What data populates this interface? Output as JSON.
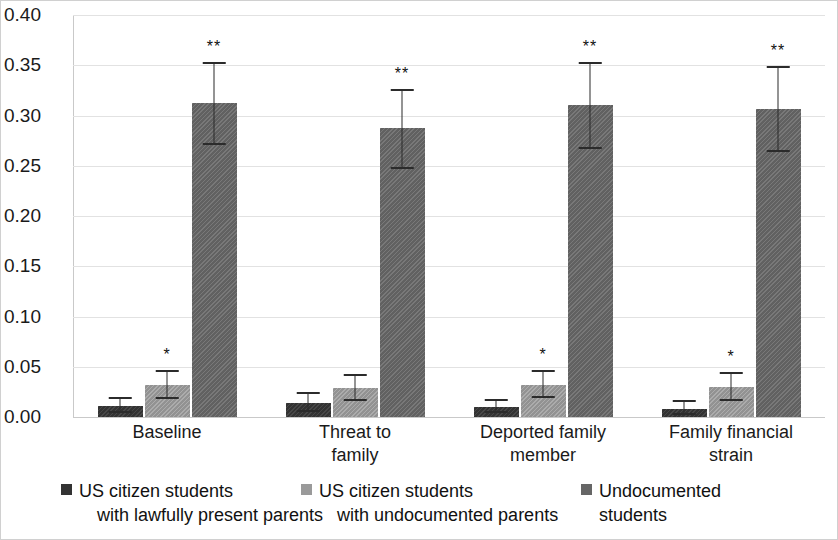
{
  "chart_data": {
    "type": "bar",
    "title": "",
    "xlabel": "",
    "ylabel": "",
    "ylim": [
      0.0,
      0.4
    ],
    "ytick_labels": [
      "0.00",
      "0.05",
      "0.10",
      "0.15",
      "0.20",
      "0.25",
      "0.30",
      "0.35",
      "0.40"
    ],
    "ytick_values": [
      0.0,
      0.05,
      0.1,
      0.15,
      0.2,
      0.25,
      0.3,
      0.35,
      0.4
    ],
    "grid": true,
    "legend_position": "bottom",
    "categories": [
      "Baseline",
      "Threat to\nfamily",
      "Deported family\nmember",
      "Family financial\nstrain"
    ],
    "series": [
      {
        "name": "US citizen students\nwith lawfully present parents",
        "color": "#333333",
        "values": [
          0.011,
          0.014,
          0.01,
          0.008
        ],
        "err_low": [
          0.005,
          0.006,
          0.005,
          0.003
        ],
        "err_high": [
          0.019,
          0.024,
          0.017,
          0.016
        ],
        "annotations": [
          "",
          "",
          "",
          ""
        ]
      },
      {
        "name": "US citizen students\nwith undocumented parents",
        "color": "#9a9a9a",
        "values": [
          0.032,
          0.029,
          0.032,
          0.03
        ],
        "err_low": [
          0.019,
          0.017,
          0.02,
          0.017
        ],
        "err_high": [
          0.046,
          0.042,
          0.046,
          0.044
        ],
        "annotations": [
          "*",
          "",
          "*",
          "*"
        ]
      },
      {
        "name": "Undocumented\nstudents",
        "color": "#666666",
        "values": [
          0.312,
          0.288,
          0.31,
          0.306
        ],
        "err_low": [
          0.272,
          0.248,
          0.268,
          0.265
        ],
        "err_high": [
          0.352,
          0.325,
          0.352,
          0.348
        ],
        "annotations": [
          "**",
          "**",
          "**",
          "**"
        ]
      }
    ]
  },
  "legend": {
    "items": [
      {
        "label_line1": "US citizen students",
        "label_line2": "with lawfully present parents",
        "swatch": "s0"
      },
      {
        "label_line1": "US citizen students",
        "label_line2": "with undocumented parents",
        "swatch": "s1"
      },
      {
        "label_line1": "Undocumented",
        "label_line2": "students",
        "swatch": "s2"
      }
    ]
  },
  "axis": {
    "categories_display": [
      {
        "line1": "Baseline",
        "line2": ""
      },
      {
        "line1": "Threat to",
        "line2": "family"
      },
      {
        "line1": "Deported family",
        "line2": "member"
      },
      {
        "line1": "Family financial",
        "line2": "strain"
      }
    ]
  }
}
